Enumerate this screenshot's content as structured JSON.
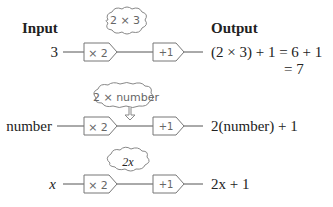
{
  "headers": {
    "input": "Input",
    "output": "Output"
  },
  "rows": [
    {
      "input": "3",
      "box1": "× 2",
      "box2": "+1",
      "cloud": "2 × 3",
      "output_line1": "(2 × 3) + 1 = 6 + 1",
      "output_line2": "= 7"
    },
    {
      "input": "number",
      "box1": "× 2",
      "box2": "+1",
      "cloud": "2 × number",
      "output_line1": "2(number) + 1"
    },
    {
      "input": "x",
      "box1": "× 2",
      "box2": "+1",
      "cloud": "2x",
      "output_line1": "2x + 1"
    }
  ]
}
